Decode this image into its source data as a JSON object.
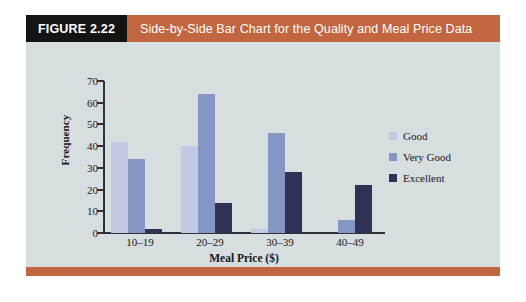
{
  "figure": {
    "number_label": "FIGURE 2.22",
    "title": "Side-by-Side Bar Chart for the Quality and Meal Price Data"
  },
  "colors": {
    "header_accent": "#c1663f",
    "header_number_bg": "#141414",
    "chart_background": "#d6dee0",
    "good": "#c3cbe4",
    "very_good": "#8496c4",
    "excellent": "#2e3254",
    "axis": "#30303a"
  },
  "chart_data": {
    "type": "bar",
    "title": "Side-by-Side Bar Chart for the Quality and Meal Price Data",
    "xlabel": "Meal Price ($)",
    "ylabel": "Frequency",
    "categories": [
      "10–19",
      "20–29",
      "30–39",
      "40–49"
    ],
    "series": [
      {
        "name": "Good",
        "color": "#c3cbe4",
        "values": [
          42,
          40,
          2,
          0
        ]
      },
      {
        "name": "Very Good",
        "color": "#8496c4",
        "values": [
          34,
          64,
          46,
          6
        ]
      },
      {
        "name": "Excellent",
        "color": "#2e3254",
        "values": [
          2,
          14,
          28,
          22
        ]
      }
    ],
    "ylim": [
      0,
      70
    ],
    "yticks": [
      0,
      10,
      20,
      30,
      40,
      50,
      60,
      70
    ],
    "grid": false,
    "legend_position": "right"
  }
}
